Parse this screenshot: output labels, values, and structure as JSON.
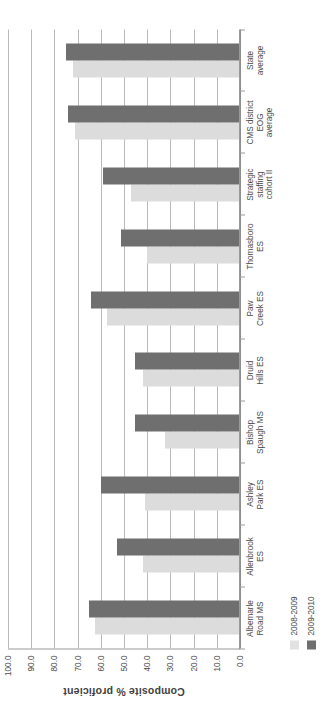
{
  "chart_data": {
    "type": "bar",
    "orientation": "vertical-rendered-rotated",
    "title": "",
    "xlabel": "",
    "ylabel": "Composite % proficient",
    "ylim": [
      0.0,
      100.0
    ],
    "yticks": [
      "0.0",
      "10.0",
      "20.0",
      "30.0",
      "40.0",
      "50.0",
      "60.0",
      "70.0",
      "80.0",
      "90.0",
      "100.0"
    ],
    "ytick_values": [
      0,
      10,
      20,
      30,
      40,
      50,
      60,
      70,
      80,
      90,
      100
    ],
    "grid": true,
    "legend_position": "bottom-left",
    "categories": [
      "Albemarle Road MS",
      "Allenbrook ES",
      "Ashley Park ES",
      "Bishop Spaugh MS",
      "Druid Hills ES",
      "Paw Creek ES",
      "Thomasboro ES",
      "Strategic staffing cohort II",
      "CMS district EOG average",
      "State average"
    ],
    "category_lines": [
      [
        "Albemarle",
        "Road MS"
      ],
      [
        "Allenbrook",
        "ES"
      ],
      [
        "Ashley",
        "Park ES"
      ],
      [
        "Bishop",
        "Spaugh MS"
      ],
      [
        "Druid",
        "Hills ES"
      ],
      [
        "Paw",
        "Creek ES"
      ],
      [
        "Thomasboro",
        "ES"
      ],
      [
        "Strategic",
        "staffing",
        "cohort II"
      ],
      [
        "CMS district",
        "EOG",
        "average"
      ],
      [
        "State",
        "average"
      ]
    ],
    "series": [
      {
        "name": "2008-2009",
        "color": "#dcdcdc",
        "values": [
          62.0,
          41.5,
          40.5,
          32.0,
          41.5,
          57.0,
          39.5,
          46.5,
          70.5,
          71.5
        ]
      },
      {
        "name": "2009-2010",
        "color": "#6f6f6f",
        "values": [
          64.5,
          52.5,
          59.5,
          45.0,
          45.0,
          64.0,
          51.0,
          58.5,
          73.5,
          74.5
        ]
      }
    ]
  },
  "legend": {
    "entries": [
      {
        "label": "2008-2009",
        "color": "#e2e2e2"
      },
      {
        "label": "2009-2010",
        "color": "#6f6f6f"
      }
    ]
  }
}
